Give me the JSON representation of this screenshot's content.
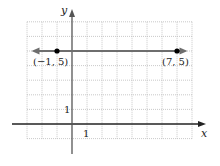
{
  "chart_data": {
    "type": "line",
    "title": "",
    "xlabel": "x",
    "ylabel": "y",
    "xlim": [
      -3,
      8
    ],
    "ylim": [
      -1,
      7
    ],
    "grid": true,
    "tick_labels": {
      "x": "1",
      "y": "1"
    },
    "series": [
      {
        "name": "horizontal line y = 5",
        "x": [
          -1,
          7
        ],
        "y": [
          5,
          5
        ],
        "arrows": "both"
      }
    ],
    "points": [
      {
        "x": -1,
        "y": 5,
        "label": "(−1, 5)"
      },
      {
        "x": 7,
        "y": 5,
        "label": "(7, 5)"
      }
    ],
    "colors": {
      "line": "#6e6e6e",
      "axis": "#222222",
      "grid": "#bbbbbb",
      "point": "#000000"
    }
  }
}
